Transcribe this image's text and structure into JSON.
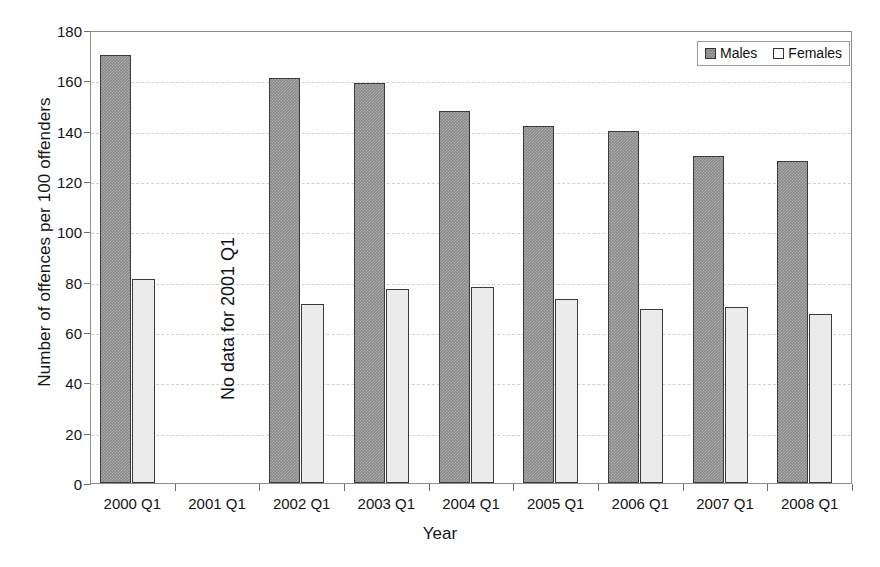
{
  "chart_data": {
    "type": "bar",
    "title": "",
    "xlabel": "Year",
    "ylabel": "Number of offences per 100 offenders",
    "ylim": [
      0,
      180
    ],
    "y_ticks": [
      0,
      20,
      40,
      60,
      80,
      100,
      120,
      140,
      160,
      180
    ],
    "grid": "horizontal-dashed",
    "legend_position": "top-right",
    "categories": [
      "2000 Q1",
      "2001 Q1",
      "2002 Q1",
      "2003 Q1",
      "2004 Q1",
      "2005 Q1",
      "2006 Q1",
      "2007 Q1",
      "2008 Q1"
    ],
    "series": [
      {
        "name": "Males",
        "color": "#8a8a8a",
        "values": [
          170,
          null,
          161,
          159,
          148,
          142,
          140,
          130,
          128
        ]
      },
      {
        "name": "Females",
        "color": "#ebebeb",
        "values": [
          81,
          null,
          71,
          77,
          78,
          73,
          69,
          70,
          67
        ]
      }
    ],
    "annotations": [
      {
        "text": "No data for 2001 Q1",
        "category": "2001 Q1",
        "orientation": "vertical"
      }
    ]
  },
  "legend": {
    "items": [
      {
        "label": "Males",
        "swatch": "males-swatch-icon"
      },
      {
        "label": "Females",
        "swatch": "females-swatch-icon"
      }
    ]
  }
}
